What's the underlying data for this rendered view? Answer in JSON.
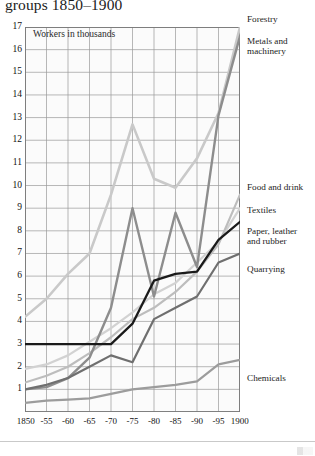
{
  "title": "groups 1850–1900",
  "annotation": "Workers in thousands",
  "axes": {
    "y_ticks": [
      "17",
      "16",
      "15",
      "14",
      "13",
      "12",
      "11",
      "10",
      "9",
      "8",
      "7",
      "6",
      "5",
      "4",
      "3",
      "2",
      "1"
    ],
    "x_ticks": [
      "1850",
      "-55",
      "-60",
      "-65",
      "-70",
      "-75",
      "-80",
      "-85",
      "-90",
      "-95",
      "1900"
    ]
  },
  "series_labels": {
    "forestry": "Forestry",
    "metals": "Metals and\nmachinery",
    "food": "Food and drink",
    "textiles": "Textiles",
    "paper": "Paper, leather\nand rubber",
    "quarrying": "Quarrying",
    "chemicals": "Chemicals"
  },
  "series_labels_flat": {
    "forestry": "Forestry",
    "metals_l1": "Metals and",
    "metals_l2": "machinery",
    "food": "Food and drink",
    "textiles": "Textiles",
    "paper_l1": "Paper, leather",
    "paper_l2": "and rubber",
    "quarrying": "Quarrying",
    "chemicals": "Chemicals"
  },
  "chart_data": {
    "type": "line",
    "title": "groups 1850–1900",
    "xlabel": "",
    "ylabel": "Workers in thousands",
    "x": [
      1850,
      1855,
      1860,
      1865,
      1870,
      1875,
      1880,
      1885,
      1890,
      1895,
      1900
    ],
    "x_tick_labels": [
      "1850",
      "-55",
      "-60",
      "-65",
      "-70",
      "-75",
      "-80",
      "-85",
      "-90",
      "-95",
      "1900"
    ],
    "xlim": [
      1850,
      1900
    ],
    "ylim": [
      0,
      17
    ],
    "y_ticks": [
      1,
      2,
      3,
      4,
      5,
      6,
      7,
      8,
      9,
      10,
      11,
      12,
      13,
      14,
      15,
      16,
      17
    ],
    "grid": true,
    "legend": "right-side series labels at line endpoints",
    "series": [
      {
        "name": "Forestry",
        "color": "#c9c9c9",
        "values": [
          4.2,
          5.0,
          6.1,
          7.0,
          9.6,
          12.7,
          10.3,
          9.9,
          11.2,
          13.2,
          17.0
        ]
      },
      {
        "name": "Metals and machinery",
        "color": "#8d8d8d",
        "values": [
          1.0,
          1.1,
          1.5,
          2.4,
          4.6,
          9.0,
          5.1,
          8.8,
          6.4,
          13.1,
          16.6
        ]
      },
      {
        "name": "Food and drink",
        "color": "#bdbdbd",
        "values": [
          1.3,
          1.6,
          2.0,
          2.6,
          3.3,
          4.1,
          4.6,
          5.3,
          6.2,
          7.4,
          9.6
        ]
      },
      {
        "name": "Textiles",
        "color": "#d2d2d2",
        "values": [
          1.9,
          2.1,
          2.5,
          3.1,
          3.7,
          4.4,
          5.2,
          5.7,
          6.6,
          7.5,
          9.0
        ]
      },
      {
        "name": "Paper, leather and rubber",
        "color": "#1a1a1a",
        "values": [
          3.0,
          3.0,
          3.0,
          3.0,
          3.0,
          3.9,
          5.8,
          6.1,
          6.2,
          7.6,
          8.4
        ]
      },
      {
        "name": "Quarrying",
        "color": "#6f6f6f",
        "values": [
          1.0,
          1.2,
          1.5,
          2.0,
          2.5,
          2.2,
          4.1,
          4.6,
          5.1,
          6.6,
          7.0
        ]
      },
      {
        "name": "Chemicals",
        "color": "#9c9c9c",
        "values": [
          0.4,
          0.5,
          0.55,
          0.6,
          0.8,
          1.0,
          1.1,
          1.2,
          1.35,
          2.1,
          2.3
        ]
      }
    ]
  }
}
